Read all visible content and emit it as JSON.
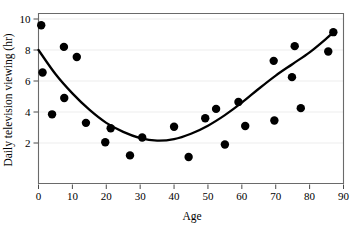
{
  "chart_data": {
    "type": "scatter",
    "title": "",
    "xlabel": "Age",
    "ylabel": "Daily television viewing (hr)",
    "xlim": [
      0,
      90
    ],
    "ylim": [
      0,
      10
    ],
    "xticks": [
      0,
      10,
      20,
      30,
      40,
      50,
      60,
      70,
      80,
      90
    ],
    "yticks": [
      2,
      4,
      6,
      8,
      10
    ],
    "xtick_labels": [
      "0",
      "10",
      "20",
      "30",
      "40",
      "50",
      "60",
      "70",
      "80",
      "90"
    ],
    "ytick_labels": [
      "2",
      "4",
      "6",
      "8",
      "10"
    ],
    "grid": "horizontal-faint",
    "legend": "none",
    "marker": {
      "shape": "circle",
      "color": "#000000",
      "size": 4.2
    },
    "points": [
      {
        "x": 0.8,
        "y": 9.6
      },
      {
        "x": 1.2,
        "y": 6.55
      },
      {
        "x": 4.0,
        "y": 3.85
      },
      {
        "x": 7.5,
        "y": 8.2
      },
      {
        "x": 7.6,
        "y": 4.9
      },
      {
        "x": 11.3,
        "y": 7.55
      },
      {
        "x": 14.0,
        "y": 3.3
      },
      {
        "x": 19.7,
        "y": 2.05
      },
      {
        "x": 21.3,
        "y": 2.95
      },
      {
        "x": 27.0,
        "y": 1.2
      },
      {
        "x": 30.6,
        "y": 2.35
      },
      {
        "x": 40.0,
        "y": 3.05
      },
      {
        "x": 44.3,
        "y": 1.1
      },
      {
        "x": 49.2,
        "y": 3.6
      },
      {
        "x": 52.4,
        "y": 4.2
      },
      {
        "x": 55.0,
        "y": 1.9
      },
      {
        "x": 59.0,
        "y": 4.65
      },
      {
        "x": 61.0,
        "y": 3.1
      },
      {
        "x": 69.4,
        "y": 7.3
      },
      {
        "x": 69.6,
        "y": 3.45
      },
      {
        "x": 74.8,
        "y": 6.25
      },
      {
        "x": 75.6,
        "y": 8.25
      },
      {
        "x": 77.4,
        "y": 4.25
      },
      {
        "x": 85.5,
        "y": 7.9
      },
      {
        "x": 87.0,
        "y": 9.15
      }
    ],
    "fit_curve": {
      "type": "quadratic",
      "description": "U-shaped least-squares quadratic trend line",
      "color": "#000000",
      "vertex": {
        "x": 35.0,
        "y": 2.15
      },
      "endpoints": [
        {
          "x": 0.0,
          "y": 8.0
        },
        {
          "x": 87.0,
          "y": 9.15
        }
      ],
      "samples": [
        {
          "x": 0,
          "y": 8.0
        },
        {
          "x": 5,
          "y": 6.45
        },
        {
          "x": 10,
          "y": 5.2
        },
        {
          "x": 15,
          "y": 4.15
        },
        {
          "x": 20,
          "y": 3.3
        },
        {
          "x": 25,
          "y": 2.72
        },
        {
          "x": 30,
          "y": 2.32
        },
        {
          "x": 35,
          "y": 2.15
        },
        {
          "x": 40,
          "y": 2.25
        },
        {
          "x": 45,
          "y": 2.6
        },
        {
          "x": 50,
          "y": 3.12
        },
        {
          "x": 55,
          "y": 3.8
        },
        {
          "x": 60,
          "y": 4.6
        },
        {
          "x": 65,
          "y": 5.5
        },
        {
          "x": 70,
          "y": 6.35
        },
        {
          "x": 75,
          "y": 7.1
        },
        {
          "x": 80,
          "y": 7.85
        },
        {
          "x": 85,
          "y": 8.75
        },
        {
          "x": 87,
          "y": 9.15
        }
      ]
    },
    "colors": {
      "axis": "#5a5a5a",
      "marker": "#000000",
      "curve": "#000000",
      "grid": "#ededed",
      "background": "#ffffff"
    }
  }
}
